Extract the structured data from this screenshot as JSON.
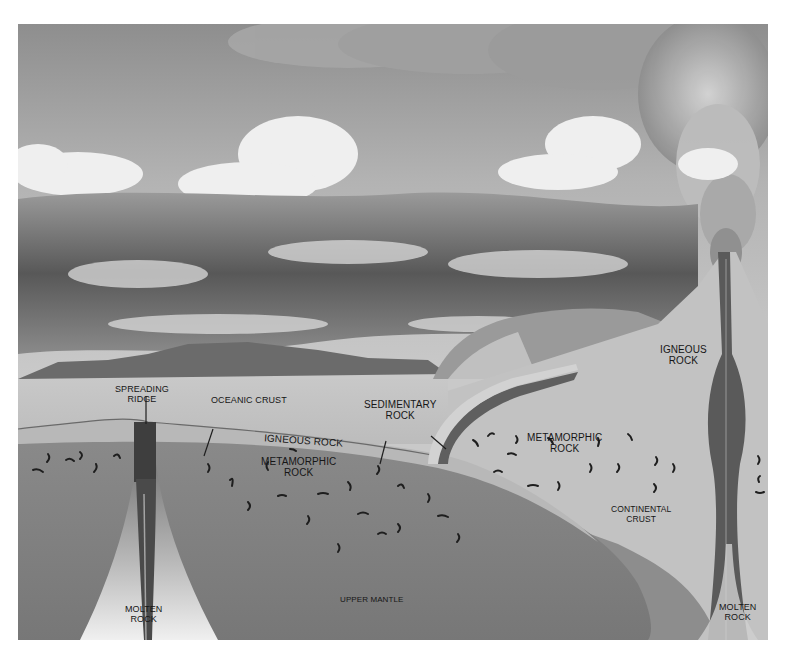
{
  "diagram": {
    "type": "rock-cycle cross-section illustration",
    "colors": {
      "sky_top": "#8f8f8f",
      "sky_bottom": "#c4c4c4",
      "cloud": "#eeeeee",
      "dark_cloud": "#5a5a5a",
      "mountains": "#6e6e6e",
      "sea_surface": "#bdbdbd",
      "crust": "#b5b5b5",
      "mantle": "#7c7c7c",
      "magma_conduit": "#555555",
      "molten_glow": "#e6e6e6",
      "sediment_band": "#6a6a6a"
    },
    "labels": {
      "spreading_ridge": [
        "SPREADING",
        "RIDGE"
      ],
      "oceanic_crust": "OCEANIC CRUST",
      "sedimentary_rock": [
        "SEDIMENTARY",
        "ROCK"
      ],
      "igneous_rock_ocean": "IGNEOUS ROCK",
      "metamorphic_rock_ocean": [
        "METAMORPHIC",
        "ROCK"
      ],
      "metamorphic_rock_continent": [
        "METAMORPHIC",
        "ROCK"
      ],
      "igneous_rock_volcano": [
        "IGNEOUS",
        "ROCK"
      ],
      "continental_crust": [
        "CONTINENTAL",
        "CRUST"
      ],
      "upper_mantle": "UPPER MANTLE",
      "molten_rock_left": [
        "MOLTEN",
        "ROCK"
      ],
      "molten_rock_right": [
        "MOLTEN",
        "ROCK"
      ]
    }
  }
}
